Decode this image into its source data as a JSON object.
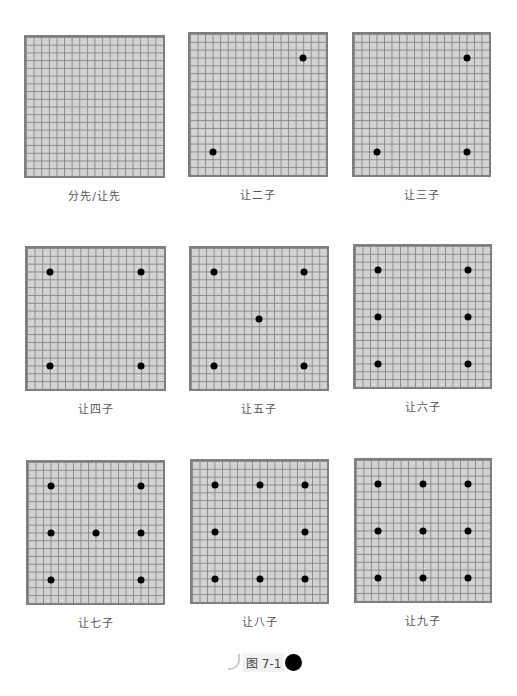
{
  "boards": [
    {
      "label": "分先/让先",
      "x": 24,
      "y": 35,
      "w": 141,
      "h": 143,
      "stones": []
    },
    {
      "label": "让二子",
      "x": 188,
      "y": 32,
      "w": 140,
      "h": 145,
      "stones": [
        [
          15,
          3
        ],
        [
          3,
          15
        ]
      ]
    },
    {
      "label": "让三子",
      "x": 352,
      "y": 32,
      "w": 139,
      "h": 145,
      "stones": [
        [
          15,
          3
        ],
        [
          3,
          15
        ],
        [
          15,
          15
        ]
      ]
    },
    {
      "label": "让四子",
      "x": 25,
      "y": 246,
      "w": 141,
      "h": 145,
      "stones": [
        [
          3,
          3
        ],
        [
          15,
          3
        ],
        [
          3,
          15
        ],
        [
          15,
          15
        ]
      ]
    },
    {
      "label": "让五子",
      "x": 189,
      "y": 246,
      "w": 140,
      "h": 145,
      "stones": [
        [
          3,
          3
        ],
        [
          15,
          3
        ],
        [
          9,
          9
        ],
        [
          3,
          15
        ],
        [
          15,
          15
        ]
      ]
    },
    {
      "label": "让六子",
      "x": 353,
      "y": 244,
      "w": 139,
      "h": 145,
      "stones": [
        [
          3,
          3
        ],
        [
          15,
          3
        ],
        [
          3,
          9
        ],
        [
          15,
          9
        ],
        [
          3,
          15
        ],
        [
          15,
          15
        ]
      ]
    },
    {
      "label": "让七子",
      "x": 26,
      "y": 460,
      "w": 139,
      "h": 145,
      "stones": [
        [
          3,
          3
        ],
        [
          15,
          3
        ],
        [
          3,
          9
        ],
        [
          9,
          9
        ],
        [
          15,
          9
        ],
        [
          3,
          15
        ],
        [
          15,
          15
        ]
      ]
    },
    {
      "label": "让八子",
      "x": 190,
      "y": 459,
      "w": 139,
      "h": 145,
      "stones": [
        [
          3,
          3
        ],
        [
          9,
          3
        ],
        [
          15,
          3
        ],
        [
          3,
          9
        ],
        [
          15,
          9
        ],
        [
          3,
          15
        ],
        [
          9,
          15
        ],
        [
          15,
          15
        ]
      ]
    },
    {
      "label": "让九子",
      "x": 354,
      "y": 458,
      "w": 138,
      "h": 145,
      "stones": [
        [
          3,
          3
        ],
        [
          9,
          3
        ],
        [
          15,
          3
        ],
        [
          3,
          9
        ],
        [
          9,
          9
        ],
        [
          15,
          9
        ],
        [
          3,
          15
        ],
        [
          9,
          15
        ],
        [
          15,
          15
        ]
      ]
    }
  ],
  "figure": {
    "label": "图 7-1"
  }
}
